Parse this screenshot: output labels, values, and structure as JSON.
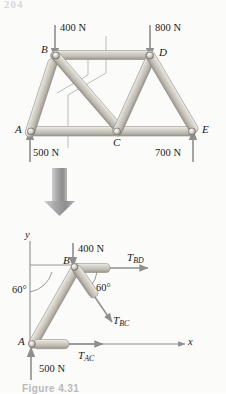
{
  "page": {
    "header_text": "204",
    "caption": "Figure 4.31"
  },
  "truss": {
    "name": "plane-truss-diagram",
    "joints": [
      {
        "id": "A",
        "label": "A",
        "x": 30,
        "y": 132
      },
      {
        "id": "B",
        "label": "B",
        "x": 55,
        "y": 55
      },
      {
        "id": "C",
        "label": "C",
        "x": 117,
        "y": 132
      },
      {
        "id": "D",
        "label": "D",
        "x": 150,
        "y": 55
      },
      {
        "id": "E",
        "label": "E",
        "x": 193,
        "y": 132
      }
    ],
    "members": [
      {
        "from": "A",
        "to": "B"
      },
      {
        "from": "B",
        "to": "C"
      },
      {
        "from": "B",
        "to": "D"
      },
      {
        "from": "C",
        "to": "D"
      },
      {
        "from": "D",
        "to": "E"
      },
      {
        "from": "A",
        "to": "C"
      },
      {
        "from": "C",
        "to": "E"
      }
    ],
    "loads": [
      {
        "id": "load-B",
        "value": "400 N",
        "direction": "down",
        "at": "B"
      },
      {
        "id": "load-D",
        "value": "800 N",
        "direction": "down",
        "at": "D"
      },
      {
        "id": "reaction-A",
        "value": "500 N",
        "direction": "up",
        "at": "A"
      },
      {
        "id": "reaction-E",
        "value": "700 N",
        "direction": "up",
        "at": "E"
      }
    ]
  },
  "transition_arrow": {
    "name": "down-arrow",
    "direction": "down"
  },
  "fbd": {
    "name": "free-body-diagram",
    "axes": {
      "x_label": "x",
      "y_label": "y"
    },
    "joint_labels": [
      {
        "id": "B",
        "label": "B"
      },
      {
        "id": "A",
        "label": "A"
      }
    ],
    "angles": [
      {
        "id": "angle-left",
        "value": "60°"
      },
      {
        "id": "angle-right",
        "value": "60°"
      }
    ],
    "forces": [
      {
        "id": "applied-400",
        "label": "400 N",
        "base": "400 N",
        "sub": "",
        "direction": "down"
      },
      {
        "id": "applied-500",
        "label": "500 N",
        "base": "500 N",
        "sub": "",
        "direction": "up"
      },
      {
        "id": "T-BD",
        "base": "T",
        "sub": "BD",
        "direction": "right"
      },
      {
        "id": "T-BC",
        "base": "T",
        "sub": "BC",
        "direction": "down-right"
      },
      {
        "id": "T-AC",
        "base": "T",
        "sub": "AC",
        "direction": "right"
      }
    ]
  },
  "colors": {
    "member_light": "#e3e0d8",
    "member_mid": "#c9c5bb",
    "member_dark": "#9d9a91",
    "arrow": "#8e8e8e",
    "text": "#1c1c1c",
    "page_bg": "#fbfbfa"
  }
}
